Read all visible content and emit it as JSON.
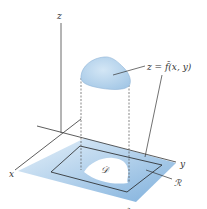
{
  "diagram": {
    "axes": {
      "z_label": "z",
      "x_label": "x",
      "y_label": "y",
      "bottom_label": "z"
    },
    "surface": {
      "label": "z = ̃f(x, y)",
      "label_text": "z = f̃(x, y)"
    },
    "region_D": {
      "label": "𝒟"
    },
    "region_R": {
      "label": "ℛ"
    },
    "colors": {
      "plane_light": "#dcebf7",
      "plane_dark": "#8fbbe0",
      "surface_fill": "#b5d3ec",
      "surface_stroke": "#8fb4d6",
      "axis": "#333333",
      "rect_stroke": "#222222",
      "hole": "#ffffff"
    }
  }
}
